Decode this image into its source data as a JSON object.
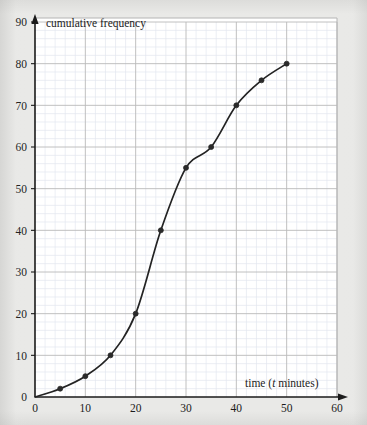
{
  "figure": {
    "background_color": "#e9e9e7",
    "plot_background_color": "#ffffff",
    "curve_color": "#232323",
    "marker_color": "#2a2a2a",
    "major_grid_color": "#b9b9b9",
    "minor_grid_color": "#e3e6ef",
    "axis_color": "#1a1a1a",
    "frame_color": "#b4b4b4"
  },
  "chart_data": {
    "type": "line",
    "title": "",
    "subtitle": "",
    "xlabel": "time (t minutes)",
    "xlabel_prefix": "time (",
    "xlabel_variable": "t",
    "xlabel_suffix": " minutes)",
    "ylabel": "cumulative frequency",
    "xlim": [
      0,
      60
    ],
    "ylim": [
      0,
      90
    ],
    "x_major_step": 10,
    "y_major_step": 10,
    "x_minor_step": 2,
    "y_minor_step": 2,
    "grid": true,
    "minor_grid": true,
    "legend": false,
    "legend_position": "none",
    "marker": "circle",
    "smoothing": "smooth-ogive",
    "xticks": [
      0,
      10,
      20,
      30,
      40,
      50,
      60
    ],
    "xtick_labels": [
      "0",
      "10",
      "20",
      "30",
      "40",
      "50",
      "60"
    ],
    "yticks": [
      0,
      10,
      20,
      30,
      40,
      50,
      60,
      70,
      80,
      90
    ],
    "ytick_labels": [
      "0",
      "10",
      "20",
      "30",
      "40",
      "50",
      "60",
      "70",
      "80",
      "90"
    ],
    "x": [
      0,
      5,
      10,
      15,
      20,
      25,
      30,
      35,
      40,
      45,
      50
    ],
    "values": [
      0,
      2,
      5,
      10,
      20,
      40,
      55,
      60,
      70,
      76,
      80
    ],
    "points": [
      {
        "x": 0,
        "y": 0
      },
      {
        "x": 5,
        "y": 2
      },
      {
        "x": 10,
        "y": 5
      },
      {
        "x": 15,
        "y": 10
      },
      {
        "x": 20,
        "y": 20
      },
      {
        "x": 25,
        "y": 40
      },
      {
        "x": 30,
        "y": 55
      },
      {
        "x": 35,
        "y": 60
      },
      {
        "x": 40,
        "y": 70
      },
      {
        "x": 45,
        "y": 76
      },
      {
        "x": 50,
        "y": 80
      }
    ]
  }
}
